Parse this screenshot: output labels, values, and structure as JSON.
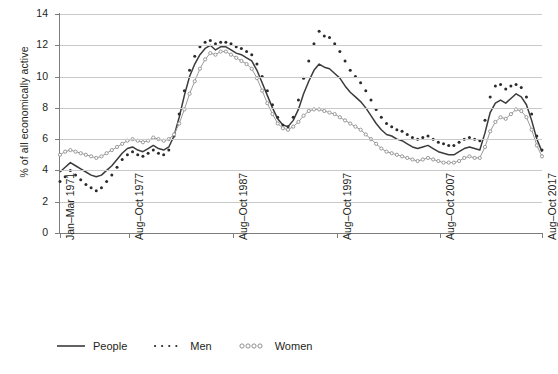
{
  "chart_data": {
    "type": "line",
    "title": "",
    "xlabel": "",
    "ylabel": "% of all economically active",
    "ylim": [
      0,
      14
    ],
    "ytick_step": 2,
    "yticks": [
      "0",
      "2",
      "4",
      "6",
      "8",
      "10",
      "12",
      "14"
    ],
    "grid": true,
    "legend_position": "bottom-left",
    "xtick_labels": [
      "Jan–Mar 1971",
      "Aug–Oct 1977",
      "Aug–Oct 1987",
      "Aug–Oct 1997",
      "Aug–Oct 2007",
      "Aug–Oct 2017"
    ],
    "xtick_positions": [
      0,
      0.1435,
      0.3587,
      0.5739,
      0.7891,
      1.0
    ],
    "x_start_label": "Jan-Mar 1971",
    "x_end_label": "Aug-Oct 2017",
    "n_points": 94,
    "series": [
      {
        "name": "People",
        "style": "solid",
        "color": "#3b3b3b",
        "values": [
          3.9,
          4.2,
          4.5,
          4.3,
          4.1,
          3.9,
          3.7,
          3.6,
          3.7,
          4.0,
          4.3,
          4.7,
          5.1,
          5.4,
          5.5,
          5.3,
          5.2,
          5.4,
          5.6,
          5.4,
          5.3,
          5.5,
          6.2,
          7.4,
          8.8,
          10.0,
          10.8,
          11.4,
          11.8,
          12.0,
          11.7,
          11.9,
          11.9,
          11.7,
          11.5,
          11.4,
          11.2,
          11.0,
          10.4,
          9.6,
          8.8,
          8.0,
          7.3,
          6.9,
          6.8,
          7.2,
          7.9,
          8.9,
          9.7,
          10.4,
          10.8,
          10.6,
          10.5,
          10.2,
          9.9,
          9.4,
          9.0,
          8.7,
          8.4,
          8.0,
          7.5,
          7.0,
          6.6,
          6.3,
          6.2,
          6.0,
          5.9,
          5.7,
          5.5,
          5.4,
          5.5,
          5.6,
          5.4,
          5.2,
          5.1,
          5.0,
          5.0,
          5.2,
          5.4,
          5.5,
          5.4,
          5.3,
          6.4,
          7.7,
          8.3,
          8.5,
          8.3,
          8.6,
          8.9,
          8.7,
          8.2,
          7.2,
          6.0,
          5.2
        ]
      },
      {
        "name": "Men",
        "style": "dotted",
        "color": "#2b2b2b",
        "values": [
          3.3,
          3.6,
          4.0,
          3.7,
          3.4,
          3.1,
          2.9,
          2.7,
          2.9,
          3.3,
          3.7,
          4.2,
          4.7,
          5.0,
          5.2,
          5.0,
          4.9,
          5.1,
          5.3,
          5.1,
          5.0,
          5.3,
          6.2,
          7.6,
          9.1,
          10.4,
          11.3,
          11.9,
          12.2,
          12.3,
          12.1,
          12.2,
          12.2,
          12.1,
          11.9,
          11.8,
          11.6,
          11.4,
          10.8,
          10.0,
          9.1,
          8.2,
          7.4,
          6.9,
          6.8,
          7.4,
          8.5,
          9.9,
          11.0,
          12.1,
          12.9,
          12.6,
          12.5,
          12.1,
          11.6,
          11.0,
          10.4,
          10.0,
          9.6,
          9.1,
          8.5,
          7.9,
          7.4,
          7.0,
          6.8,
          6.6,
          6.5,
          6.3,
          6.1,
          6.0,
          6.1,
          6.2,
          6.0,
          5.8,
          5.7,
          5.6,
          5.6,
          5.8,
          6.0,
          6.1,
          6.0,
          5.9,
          7.2,
          8.7,
          9.4,
          9.5,
          9.2,
          9.4,
          9.5,
          9.3,
          8.7,
          7.6,
          6.2,
          5.3
        ]
      },
      {
        "name": "Women",
        "style": "circles",
        "color": "#9a9a9a",
        "values": [
          5.0,
          5.2,
          5.3,
          5.2,
          5.1,
          5.0,
          4.9,
          4.8,
          4.9,
          5.1,
          5.3,
          5.5,
          5.7,
          5.9,
          6.0,
          5.9,
          5.8,
          5.9,
          6.1,
          6.0,
          5.9,
          6.0,
          6.3,
          7.0,
          7.9,
          8.9,
          9.7,
          10.5,
          11.1,
          11.5,
          11.4,
          11.6,
          11.6,
          11.4,
          11.2,
          11.0,
          10.8,
          10.5,
          9.9,
          9.1,
          8.3,
          7.6,
          7.0,
          6.7,
          6.6,
          6.8,
          7.1,
          7.5,
          7.8,
          7.9,
          7.9,
          7.8,
          7.7,
          7.6,
          7.4,
          7.2,
          7.0,
          6.8,
          6.6,
          6.3,
          6.0,
          5.7,
          5.4,
          5.2,
          5.1,
          5.0,
          4.9,
          4.8,
          4.7,
          4.6,
          4.7,
          4.8,
          4.7,
          4.6,
          4.5,
          4.5,
          4.5,
          4.6,
          4.8,
          4.9,
          4.8,
          4.8,
          5.5,
          6.5,
          7.1,
          7.4,
          7.3,
          7.6,
          7.9,
          7.8,
          7.4,
          6.6,
          5.6,
          4.9
        ]
      }
    ]
  },
  "legend": {
    "items": [
      {
        "label": "People",
        "swatch": "solid-line-swatch"
      },
      {
        "label": "Men",
        "swatch": "dotted-line-swatch"
      },
      {
        "label": "Women",
        "swatch": "circle-chain-swatch"
      }
    ]
  }
}
